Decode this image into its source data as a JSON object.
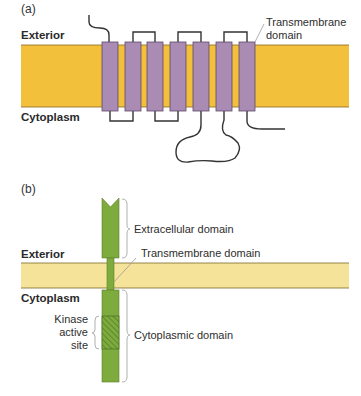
{
  "panel_a": {
    "label": "(a)",
    "exterior_label": "Exterior",
    "cytoplasm_label": "Cytoplasm",
    "transmembrane_label_line1": "Transmembrane",
    "transmembrane_label_line2": "domain",
    "helix_count": 7,
    "colors": {
      "membrane": "#f2c03a",
      "helix": "#a98bb3",
      "loop": "#333333"
    }
  },
  "panel_b": {
    "label": "(b)",
    "exterior_label": "Exterior",
    "cytoplasm_label": "Cytoplasm",
    "extracellular_domain_label": "Extracellular domain",
    "transmembrane_domain_label": "Transmembrane domain",
    "cytoplasmic_domain_label": "Cytoplasmic domain",
    "kinase_label_line1": "Kinase",
    "kinase_label_line2": "active",
    "kinase_label_line3": "site",
    "colors": {
      "membrane": "#f6e39a",
      "receptor": "#7eab3e",
      "hatch": "#4f7a22"
    }
  }
}
